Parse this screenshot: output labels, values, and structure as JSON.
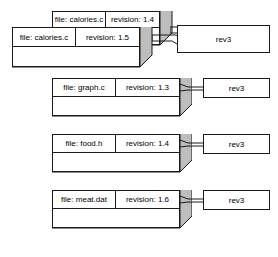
{
  "diagram": {
    "colors": {
      "box_face": "#ffffff",
      "box_side": "#bdbdbd",
      "box_bottom": "#b5b5b5",
      "outline": "#1a1a1a",
      "background": "#ffffff"
    },
    "labels": {
      "file_prefix": "file:",
      "revision_prefix": "revision:"
    },
    "boxes": [
      {
        "id": "calories-back",
        "file": "file: calories.c",
        "revision": "revision: 1.4",
        "rev_tag": "rev3",
        "layer": "back"
      },
      {
        "id": "calories-front",
        "file": "file: calories.c",
        "revision": "revision: 1.5",
        "rev_tag": "rev3",
        "layer": "front"
      },
      {
        "id": "graph",
        "file": "file: graph.c",
        "revision": "revision: 1.3",
        "rev_tag": "rev3",
        "layer": "front"
      },
      {
        "id": "food",
        "file": "file: food.h",
        "revision": "revision: 1.4",
        "rev_tag": "rev3",
        "layer": "front"
      },
      {
        "id": "meat",
        "file": "file: meat.dat",
        "revision": "revision: 1.6",
        "rev_tag": "rev3",
        "layer": "front"
      }
    ]
  }
}
